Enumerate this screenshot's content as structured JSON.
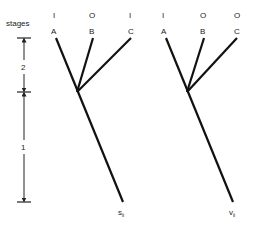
{
  "axis": {
    "title": "stages",
    "stage_upper": "2",
    "stage_lower": "1"
  },
  "trees": [
    {
      "id": "left",
      "leaves": [
        {
          "state": "I",
          "name": "A"
        },
        {
          "state": "O",
          "name": "B"
        },
        {
          "state": "I",
          "name": "C"
        }
      ],
      "root_label": "s",
      "root_subscript": "ii"
    },
    {
      "id": "right",
      "leaves": [
        {
          "state": "I",
          "name": "A"
        },
        {
          "state": "O",
          "name": "B"
        },
        {
          "state": "O",
          "name": "C"
        }
      ],
      "root_label": "v",
      "root_subscript": "ii"
    }
  ]
}
